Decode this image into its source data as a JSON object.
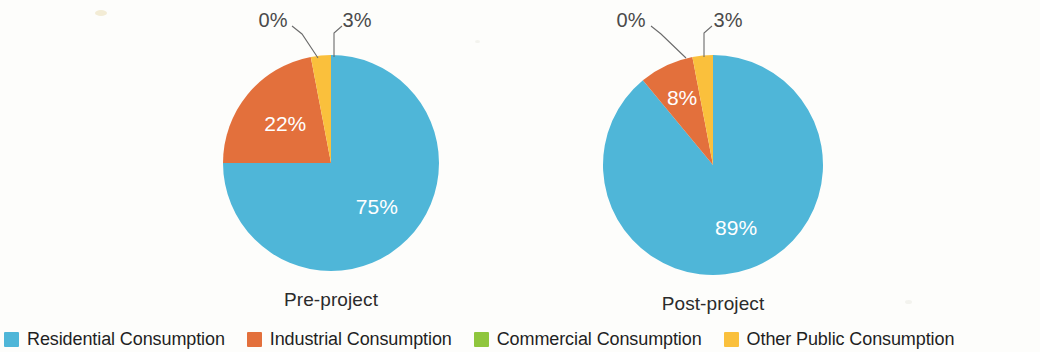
{
  "chart_data": {
    "type": "pie",
    "title": "",
    "legend_position": "bottom",
    "categories": [
      "Residential Consumption",
      "Industrial Consumption",
      "Commercial Consumption",
      "Other Public Consumption"
    ],
    "colors": [
      "#4FB6D8",
      "#E3703C",
      "#8FC63D",
      "#FAC03C"
    ],
    "charts": [
      {
        "name": "Pre-project",
        "label": "Pre-project",
        "values": [
          75,
          22,
          0,
          3
        ],
        "value_labels": [
          "75%",
          "22%",
          "0%",
          "3%"
        ],
        "inside_labels": [
          "75%",
          "22%"
        ],
        "callout_labels": [
          "0%",
          "3%"
        ]
      },
      {
        "name": "Post-project",
        "label": "Post-project",
        "values": [
          89,
          8,
          0,
          3
        ],
        "value_labels": [
          "89%",
          "8%",
          "0%",
          "3%"
        ],
        "inside_labels": [
          "89%",
          "8%"
        ],
        "callout_labels": [
          "0%",
          "3%"
        ]
      }
    ]
  },
  "legend": {
    "items": [
      {
        "label": "Residential Consumption",
        "color": "#4FB6D8"
      },
      {
        "label": "Industrial Consumption",
        "color": "#E3703C"
      },
      {
        "label": "Commercial Consumption",
        "color": "#8FC63D"
      },
      {
        "label": "Other Public Consumption",
        "color": "#FAC03C"
      }
    ]
  },
  "pies": [
    {
      "caption": "Pre-project",
      "center_x": 331,
      "center_y": 163,
      "radius": 108,
      "slices": [
        {
          "name": "Residential Consumption",
          "percent": 75,
          "color": "#4FB6D8",
          "label": "75%",
          "label_inside": true,
          "label_r": 0.6
        },
        {
          "name": "Industrial Consumption",
          "percent": 22,
          "color": "#E3703C",
          "label": "22%",
          "label_inside": true,
          "label_r": 0.55
        },
        {
          "name": "Commercial Consumption",
          "percent": 0,
          "color": "#8FC63D",
          "label": "0%",
          "label_inside": false
        },
        {
          "name": "Other Public Consumption",
          "percent": 3,
          "color": "#FAC03C",
          "label": "3%",
          "label_inside": false
        }
      ],
      "callouts": [
        {
          "text": "0%",
          "tx": 273,
          "ty": 22,
          "lx1": 292,
          "ly1": 26,
          "lx2": 302,
          "ly2": 34,
          "lx3": 318,
          "ly3": 58
        },
        {
          "text": "3%",
          "tx": 357,
          "ty": 22,
          "lx1": 342,
          "ly1": 26,
          "lx2": 334,
          "ly2": 33,
          "lx3": 334,
          "ly3": 57
        }
      ]
    },
    {
      "caption": "Post-project",
      "center_x": 713,
      "center_y": 165,
      "radius": 110,
      "slices": [
        {
          "name": "Residential Consumption",
          "percent": 89,
          "color": "#4FB6D8",
          "label": "89%",
          "label_inside": true,
          "label_r": 0.62
        },
        {
          "name": "Industrial Consumption",
          "percent": 8,
          "color": "#E3703C",
          "label": "8%",
          "label_inside": true,
          "label_r": 0.66
        },
        {
          "name": "Commercial Consumption",
          "percent": 0,
          "color": "#8FC63D",
          "label": "0%",
          "label_inside": false
        },
        {
          "name": "Other Public Consumption",
          "percent": 3,
          "color": "#FAC03C",
          "label": "3%",
          "label_inside": false
        }
      ],
      "callouts": [
        {
          "text": "0%",
          "tx": 631,
          "ty": 22,
          "lx1": 651,
          "ly1": 26,
          "lx2": 661,
          "ly2": 34,
          "lx3": 686,
          "ly3": 58
        },
        {
          "text": "3%",
          "tx": 728,
          "ty": 22,
          "lx1": 712,
          "ly1": 26,
          "lx2": 704,
          "ly2": 33,
          "lx3": 704,
          "ly3": 57
        }
      ]
    }
  ]
}
